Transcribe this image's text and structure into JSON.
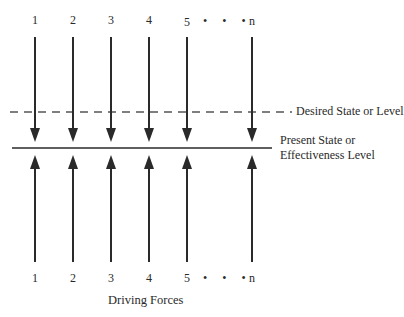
{
  "diagram": {
    "type": "force-field",
    "top_labels": [
      "1",
      "2",
      "3",
      "4",
      "5",
      "n"
    ],
    "bottom_labels": [
      "1",
      "2",
      "3",
      "4",
      "5",
      "n"
    ],
    "ellipsis": "• • •",
    "desired_line_label": "Desired State or Level",
    "present_line_label_1": "Present State or",
    "present_line_label_2": "Effectiveness Level",
    "caption": "Driving Forces",
    "line_color": "#2a2a2a",
    "dashed_color": "#555555"
  }
}
